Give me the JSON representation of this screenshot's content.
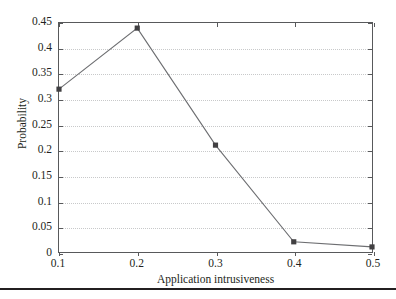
{
  "chart_data": {
    "type": "line",
    "title": "",
    "subtitle": "",
    "xlabel": "Application intrusiveness",
    "ylabel": "Probability",
    "x": [
      0.1,
      0.2,
      0.3,
      0.4,
      0.5
    ],
    "values": [
      0.32,
      0.44,
      0.21,
      0.02,
      0.01
    ],
    "series": [
      {
        "name": "Probability",
        "x": [
          0.1,
          0.2,
          0.3,
          0.4,
          0.5
        ],
        "values": [
          0.32,
          0.44,
          0.21,
          0.02,
          0.01
        ]
      }
    ],
    "xlim": [
      0.1,
      0.5
    ],
    "ylim": [
      0,
      0.45
    ],
    "xticks": [
      0.1,
      0.2,
      0.3,
      0.4,
      0.5
    ],
    "yticks": [
      0,
      0.05,
      0.1,
      0.15,
      0.2,
      0.25,
      0.3,
      0.35,
      0.4,
      0.45
    ],
    "xtick_labels": [
      "0.1",
      "0.2",
      "0.3",
      "0.4",
      "0.5"
    ],
    "ytick_labels": [
      "0",
      "0.05",
      "0.1",
      "0.15",
      "0.2",
      "0.25",
      "0.3",
      "0.35",
      "0.4",
      "0.45"
    ],
    "grid": true,
    "grid_axis": "y",
    "grid_style": "dotted",
    "legend": false,
    "legend_position": "none",
    "marker": "square",
    "line_color": "#6d6e71",
    "marker_color": "#414042",
    "grid_color": "#c8c9ca",
    "frame_color": "#58595b",
    "background_color": "#ffffff",
    "annotations": []
  },
  "figure": {
    "page_rule_color": "#231f20"
  }
}
